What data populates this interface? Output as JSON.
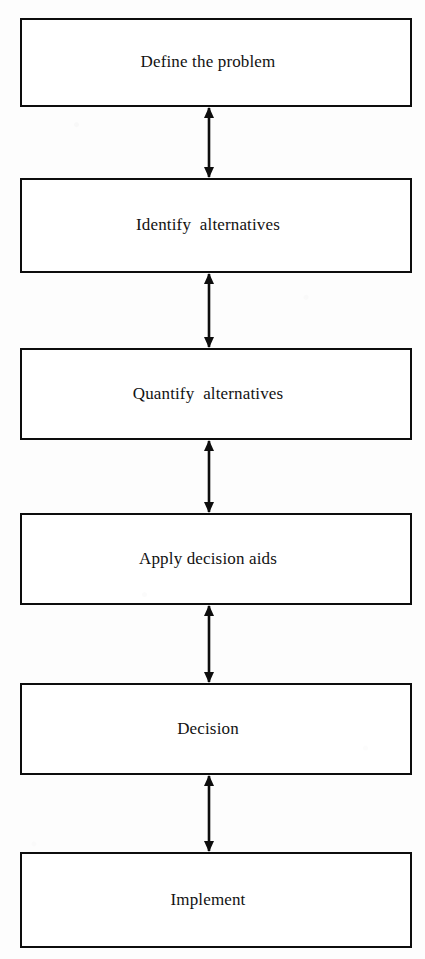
{
  "diagram": {
    "orientation": "vertical",
    "background_color": "#fdfdfd",
    "line_color": "#0d0d0d",
    "text_color": "#121212",
    "nodes": [
      {
        "id": "define-the-problem",
        "label": "Define the problem",
        "x": 20,
        "y": 18,
        "width": 392,
        "height": 89
      },
      {
        "id": "identify-alternatives",
        "label": "Identify  alternatives",
        "x": 20,
        "y": 178,
        "width": 392,
        "height": 95
      },
      {
        "id": "quantify-alternatives",
        "label": "Quantify  alternatives",
        "x": 20,
        "y": 348,
        "width": 392,
        "height": 92
      },
      {
        "id": "apply-decision-aids",
        "label": "Apply decision aids",
        "x": 20,
        "y": 513,
        "width": 392,
        "height": 92
      },
      {
        "id": "decision",
        "label": "Decision",
        "x": 20,
        "y": 683,
        "width": 392,
        "height": 92
      },
      {
        "id": "implement",
        "label": "Implement",
        "x": 20,
        "y": 852,
        "width": 392,
        "height": 96
      }
    ],
    "connectors": [
      {
        "id": "connector-1",
        "from": "define-the-problem",
        "to": "identify-alternatives",
        "type": "double-headed-arrow",
        "x": 209,
        "y_start": 107,
        "y_end": 178
      },
      {
        "id": "connector-2",
        "from": "identify-alternatives",
        "to": "quantify-alternatives",
        "type": "double-headed-arrow",
        "x": 209,
        "y_start": 273,
        "y_end": 348
      },
      {
        "id": "connector-3",
        "from": "quantify-alternatives",
        "to": "apply-decision-aids",
        "type": "double-headed-arrow",
        "x": 209,
        "y_start": 440,
        "y_end": 513
      },
      {
        "id": "connector-4",
        "from": "apply-decision-aids",
        "to": "decision",
        "type": "double-headed-arrow",
        "x": 209,
        "y_start": 605,
        "y_end": 683
      },
      {
        "id": "connector-5",
        "from": "decision",
        "to": "implement",
        "type": "double-headed-arrow",
        "x": 209,
        "y_start": 775,
        "y_end": 852
      }
    ]
  }
}
